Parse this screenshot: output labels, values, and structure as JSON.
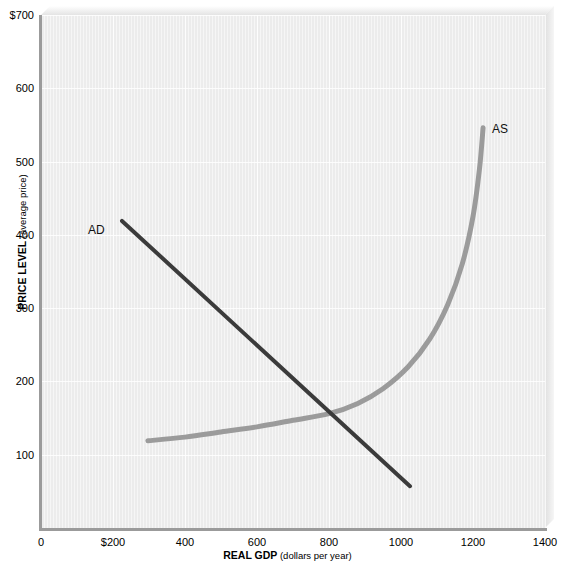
{
  "chart_data": {
    "type": "line",
    "title": "",
    "xlabel_bold": "REAL GDP",
    "xlabel_regular": " (dollars per year)",
    "ylabel_bold": "PRICE LEVEL",
    "ylabel_regular": " (average price)",
    "xlim": [
      0,
      1400
    ],
    "ylim": [
      0,
      700
    ],
    "grid": true,
    "legend_position": "inline-curve-labels",
    "xticks": [
      {
        "value": 0,
        "label": "0"
      },
      {
        "value": 200,
        "label": "$200"
      },
      {
        "value": 400,
        "label": "400"
      },
      {
        "value": 600,
        "label": "600"
      },
      {
        "value": 800,
        "label": "800"
      },
      {
        "value": 1000,
        "label": "1000"
      },
      {
        "value": 1200,
        "label": "1200"
      },
      {
        "value": 1400,
        "label": "1400"
      }
    ],
    "yticks": [
      {
        "value": 100,
        "label": "100"
      },
      {
        "value": 200,
        "label": "200"
      },
      {
        "value": 300,
        "label": "300"
      },
      {
        "value": 400,
        "label": "400"
      },
      {
        "value": 500,
        "label": "500"
      },
      {
        "value": 600,
        "label": "600"
      },
      {
        "value": 700,
        "label": "$700"
      }
    ],
    "series": [
      {
        "name": "AD",
        "label": "AD",
        "color": "#3b3b3b",
        "width": 4,
        "shape": "straight-line",
        "points": [
          {
            "x": 225,
            "y": 419
          },
          {
            "x": 1025,
            "y": 57
          }
        ]
      },
      {
        "name": "AS",
        "label": "AS",
        "color": "#9b9b9b",
        "width": 5,
        "shape": "upward-sloping-curve",
        "points": [
          {
            "x": 297,
            "y": 119
          },
          {
            "x": 400,
            "y": 124
          },
          {
            "x": 500,
            "y": 131
          },
          {
            "x": 600,
            "y": 138
          },
          {
            "x": 700,
            "y": 147
          },
          {
            "x": 800,
            "y": 156
          },
          {
            "x": 880,
            "y": 170
          },
          {
            "x": 950,
            "y": 190
          },
          {
            "x": 1020,
            "y": 220
          },
          {
            "x": 1080,
            "y": 258
          },
          {
            "x": 1130,
            "y": 305
          },
          {
            "x": 1170,
            "y": 360
          },
          {
            "x": 1200,
            "y": 425
          },
          {
            "x": 1218,
            "y": 490
          },
          {
            "x": 1228,
            "y": 546
          }
        ]
      }
    ],
    "annotations": [
      {
        "name": "equilibrium",
        "x": 803,
        "y": 155,
        "note": "AD and AS intersect"
      }
    ],
    "colors": {
      "plot_background": "#ececec",
      "axis": "#9b9b9b",
      "gridline": "#ffffff",
      "ad_curve": "#3b3b3b",
      "as_curve": "#9b9b9b",
      "text": "#000000"
    }
  }
}
